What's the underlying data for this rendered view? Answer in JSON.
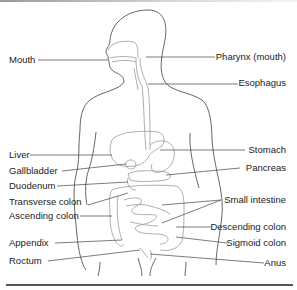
{
  "diagram": {
    "type": "anatomy-labeled-illustration",
    "colors": {
      "outline": "#555555",
      "organ_stroke": "#9a9a9a",
      "label_text": "#222222",
      "rule": "#555555"
    },
    "labels_left": [
      {
        "id": "mouth",
        "text": "Mouth"
      },
      {
        "id": "liver",
        "text": "Liver"
      },
      {
        "id": "gallbladder",
        "text": "Gallbladder"
      },
      {
        "id": "duodenum",
        "text": "Duodenum"
      },
      {
        "id": "transverse-colon",
        "text": "Transverse colon"
      },
      {
        "id": "ascending-colon",
        "text": "Ascending colon"
      },
      {
        "id": "appendix",
        "text": "Appendix"
      },
      {
        "id": "rectum",
        "text": "Roctum"
      }
    ],
    "labels_right": [
      {
        "id": "pharynx",
        "text": "Pharynx (mouth)"
      },
      {
        "id": "esophagus",
        "text": "Esophagus"
      },
      {
        "id": "stomach",
        "text": "Stomach"
      },
      {
        "id": "pancreas",
        "text": "Pancreas"
      },
      {
        "id": "small-intestine",
        "text": "Small intestine"
      },
      {
        "id": "descending-colon",
        "text": "Descending colon"
      },
      {
        "id": "sigmoid-colon",
        "text": "Sigmoid colon"
      },
      {
        "id": "anus",
        "text": "Anus"
      }
    ]
  }
}
